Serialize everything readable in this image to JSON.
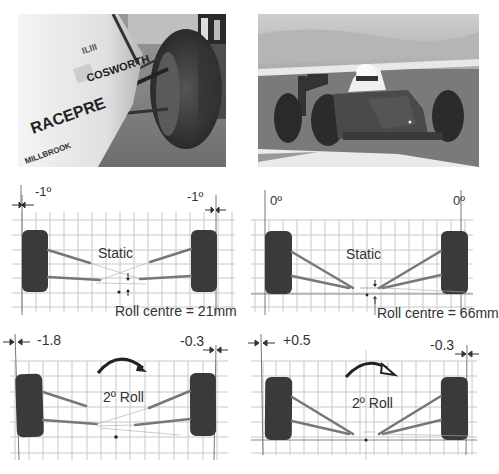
{
  "photos": [
    {
      "name": "photo-car-side-suspension",
      "description": "Close-up of race car sidepod and front suspension",
      "sidepod_text": [
        "COSWORTH",
        "RACEPRE",
        "MILLBROOK"
      ]
    },
    {
      "name": "photo-car-on-track",
      "description": "Single-seater race car on circuit"
    }
  ],
  "diagrams": [
    {
      "id": "a",
      "state_label": "Static",
      "left_camber": "-1º",
      "right_camber": "-1º",
      "roll_centre_label": "Roll centre = 21mm",
      "has_roll_arrow": false
    },
    {
      "id": "b",
      "state_label": "Static",
      "left_camber": "0º",
      "right_camber": "0º",
      "roll_centre_label": "Roll centre = 66mm",
      "has_roll_arrow": false
    },
    {
      "id": "c",
      "state_label": "2º Roll",
      "left_camber": "-1.8",
      "right_camber": "-0.3",
      "roll_centre_label": "",
      "has_roll_arrow": true,
      "arrow_style": "filled"
    },
    {
      "id": "d",
      "state_label": "2º Roll",
      "left_camber": "+0.5",
      "right_camber": "-0.3",
      "roll_centre_label": "",
      "has_roll_arrow": true,
      "arrow_style": "open"
    }
  ],
  "colors": {
    "grid": "#c8c8c8",
    "tyre": "#3a3a3a",
    "arm": "#777777",
    "text": "#333333"
  }
}
